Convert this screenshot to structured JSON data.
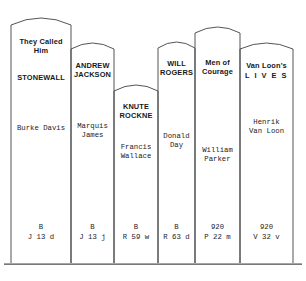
{
  "diagram": {
    "name": "library-book-spines",
    "shelf_line_color": "#4a4c4f",
    "spine_outline_color": "#3f4144",
    "background": "#ffffff",
    "books": [
      {
        "id": "stonewall",
        "title": "They Called\nHim",
        "title2": "STONEWALL",
        "author": "Burke Davis",
        "call_number": "B\nJ 13 d",
        "call_class": "B",
        "call_line2": "J 13 d"
      },
      {
        "id": "andrew-jackson",
        "title": "ANDREW\nJACKSON",
        "title2": "",
        "author": "Marquis\nJames",
        "call_number": "B\nJ 13 j",
        "call_class": "B",
        "call_line2": "J 13 j"
      },
      {
        "id": "knute-rockne",
        "title": "KNUTE\nROCKNE",
        "title2": "",
        "author": "Francis\nWallace",
        "call_number": "B\nR 59 w",
        "call_class": "B",
        "call_line2": "R 59 w"
      },
      {
        "id": "will-rogers",
        "title": "WILL\nROGERS",
        "title2": "",
        "author": "Donald\nDay",
        "call_number": "B\nR 63 d",
        "call_class": "B",
        "call_line2": "R 63 d"
      },
      {
        "id": "men-of-courage",
        "title": "Men of\nCourage",
        "title2": "",
        "author": "William\nParker",
        "call_number": "920\nP 22 m",
        "call_class": "920",
        "call_line2": "P 22 m"
      },
      {
        "id": "van-loons-lives",
        "title": "Van Loon's",
        "title2": "L I V E S",
        "author": "Henrik\nVan Loon",
        "call_number": "920\nV 32 v",
        "call_class": "920",
        "call_line2": "V 32 v"
      }
    ]
  }
}
